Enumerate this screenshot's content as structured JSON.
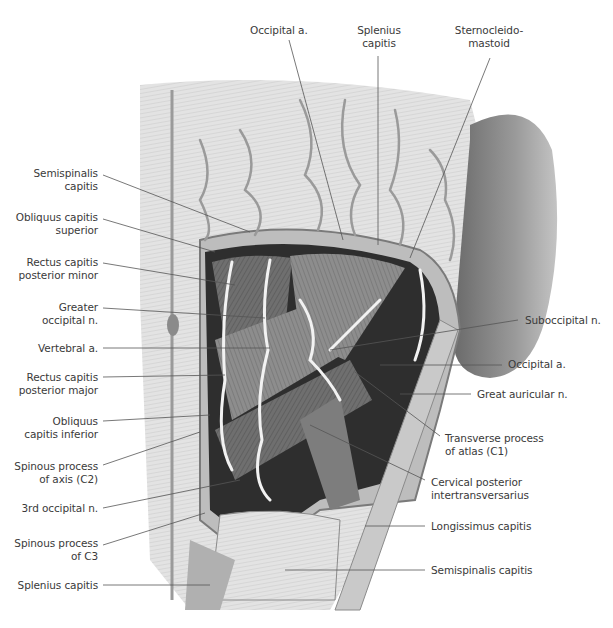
{
  "figure": {
    "type": "anatomical-illustration",
    "colors": {
      "background": "#ffffff",
      "label_text": "#3a3a3a",
      "leader_line": "#555555",
      "skin": "#e6e6e6",
      "muscle_dark": "#5a5a5a",
      "muscle_mid": "#8c8c8c",
      "vessel": "#f2f2f2",
      "shadow": "#2b2b2b"
    }
  },
  "labels": {
    "top": [
      {
        "id": "occipital-a-top",
        "lines": [
          "Occipital a."
        ],
        "x": 276,
        "y": 25
      },
      {
        "id": "splenius-capitis-top",
        "lines": [
          "Splenius",
          "capitis"
        ],
        "x": 378,
        "y": 25
      },
      {
        "id": "sternocleidomastoid",
        "lines": [
          "Sternocleido-",
          "mastoid"
        ],
        "x": 480,
        "y": 25
      }
    ],
    "left": [
      {
        "id": "semispinalis-capitis-left",
        "lines": [
          "Semispinalis",
          "capitis"
        ],
        "y": 170
      },
      {
        "id": "obliquus-capitis-superior",
        "lines": [
          "Obliquus capitis",
          "superior"
        ],
        "y": 213
      },
      {
        "id": "rectus-capitis-posterior-minor",
        "lines": [
          "Rectus capitis",
          "posterior minor"
        ],
        "y": 258
      },
      {
        "id": "greater-occipital-n",
        "lines": [
          "Greater",
          "occipital n."
        ],
        "y": 303
      },
      {
        "id": "vertebral-a",
        "lines": [
          "Vertebral a."
        ],
        "y": 344
      },
      {
        "id": "rectus-capitis-posterior-major",
        "lines": [
          "Rectus capitis",
          "posterior major"
        ],
        "y": 372
      },
      {
        "id": "obliquus-capitis-inferior",
        "lines": [
          "Obliquus",
          "capitis inferior"
        ],
        "y": 416
      },
      {
        "id": "spinous-process-axis",
        "lines": [
          "Spinous process",
          "of axis (C2)"
        ],
        "y": 461
      },
      {
        "id": "3rd-occipital-n",
        "lines": [
          "3rd occipital n."
        ],
        "y": 503
      },
      {
        "id": "spinous-process-c3",
        "lines": [
          "Spinous process",
          "of C3"
        ],
        "y": 538
      },
      {
        "id": "splenius-capitis-left",
        "lines": [
          "Splenius capitis"
        ],
        "y": 580
      }
    ],
    "right": [
      {
        "id": "suboccipital-n",
        "lines": [
          "Suboccipital n."
        ],
        "x": 525,
        "y": 316
      },
      {
        "id": "occipital-a-right",
        "lines": [
          "Occipital a."
        ],
        "x": 508,
        "y": 360
      },
      {
        "id": "great-auricular-n",
        "lines": [
          "Great auricular n."
        ],
        "x": 477,
        "y": 389
      },
      {
        "id": "transverse-process-atlas",
        "lines": [
          "Transverse process",
          "of atlas (C1)"
        ],
        "x": 445,
        "y": 433
      },
      {
        "id": "cervical-posterior-intertransversarius",
        "lines": [
          "Cervical posterior",
          "intertransversarius"
        ],
        "x": 431,
        "y": 477
      },
      {
        "id": "longissimus-capitis",
        "lines": [
          "Longissimus capitis"
        ],
        "x": 431,
        "y": 521
      },
      {
        "id": "semispinalis-capitis-right",
        "lines": [
          "Semispinalis capitis"
        ],
        "x": 431,
        "y": 564
      }
    ]
  }
}
